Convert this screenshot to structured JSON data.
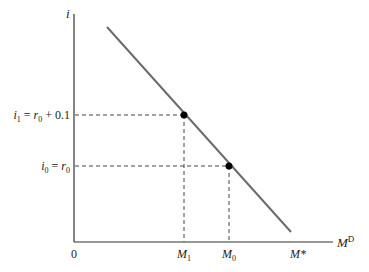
{
  "diagram": {
    "type": "money-demand",
    "axes": {
      "y_label": "i",
      "x_label_main": "M",
      "x_label_sup": "D",
      "origin_label": "0"
    },
    "curve": {
      "name": "money demand line",
      "color": "#6b6b6b",
      "end_label": "M*"
    },
    "points": [
      {
        "y_label_parts": {
          "i": "i",
          "sub": "1",
          "eq": " = ",
          "r": "r",
          "rsub": "0",
          "rest": " + 0.1"
        },
        "x_label_parts": {
          "m": "M",
          "sub": "1"
        }
      },
      {
        "y_label_parts": {
          "i": "i",
          "sub": "0",
          "eq": " = ",
          "r": "r",
          "rsub": "0"
        },
        "x_label_parts": {
          "m": "M",
          "sub": "0"
        }
      }
    ]
  }
}
